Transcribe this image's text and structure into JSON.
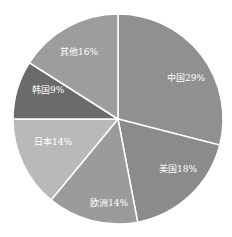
{
  "chart_data": {
    "type": "pie",
    "title": "",
    "start_angle_deg": 0,
    "direction": "clockwise",
    "center": [
      118,
      119
    ],
    "radius": 105,
    "slices": [
      {
        "label": "中国",
        "value": 29,
        "text": "中国29%",
        "color": "#909090"
      },
      {
        "label": "美国",
        "value": 18,
        "text": "美国18%",
        "color": "#8b8b8b"
      },
      {
        "label": "欧洲",
        "value": 14,
        "text": "欧洲14%",
        "color": "#9b9b9b"
      },
      {
        "label": "日本",
        "value": 14,
        "text": "日本14%",
        "color": "#b9b9b9"
      },
      {
        "label": "韩国",
        "value": 9,
        "text": "韩国9%",
        "color": "#6b6b6b"
      },
      {
        "label": "其他",
        "value": 16,
        "text": "其他16%",
        "color": "#9d9d9d"
      }
    ],
    "label_positions": [
      [
        167,
        81
      ],
      [
        159,
        172
      ],
      [
        90,
        206
      ],
      [
        34,
        145
      ],
      [
        32,
        93
      ],
      [
        60,
        55
      ]
    ],
    "legend": "none",
    "border_color": "#ffffff"
  }
}
